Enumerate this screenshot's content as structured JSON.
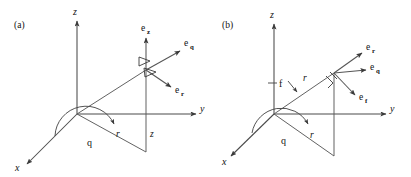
{
  "figure": {
    "caption_panels": [
      {
        "id": "a",
        "label": "(a)",
        "system": "cylindrical"
      },
      {
        "id": "b",
        "label": "(b)",
        "system": "spherical"
      }
    ],
    "background_color": "#ffffff",
    "line_color": "#4a4a4a",
    "text_color": "#111111"
  },
  "panel_a": {
    "panel_label": "(a)",
    "axes": [
      {
        "name": "z",
        "label": "z",
        "direction": "up"
      },
      {
        "name": "y",
        "label": "y",
        "direction": "right"
      },
      {
        "name": "x",
        "label": "x",
        "direction": "lower-left"
      }
    ],
    "scalars": [
      {
        "name": "radius",
        "label": "r"
      },
      {
        "name": "height",
        "label": "z"
      }
    ],
    "angles": [
      {
        "name": "theta",
        "label": "q"
      }
    ],
    "unit_vectors": [
      {
        "name": "e-z",
        "base": "e",
        "subscript": "z",
        "direction": "up"
      },
      {
        "name": "e-q",
        "base": "e",
        "subscript": "q",
        "direction": "upper-right"
      },
      {
        "name": "e-r",
        "base": "e",
        "subscript": "r",
        "direction": "lower-right"
      }
    ]
  },
  "panel_b": {
    "panel_label": "(b)",
    "axes": [
      {
        "name": "z",
        "label": "z",
        "direction": "up"
      },
      {
        "name": "y",
        "label": "y",
        "direction": "right"
      },
      {
        "name": "x",
        "label": "x",
        "direction": "lower-left"
      }
    ],
    "scalars": [
      {
        "name": "radius-upper",
        "label": "r"
      },
      {
        "name": "radius-lower",
        "label": "r"
      }
    ],
    "angles": [
      {
        "name": "theta",
        "label": "q"
      },
      {
        "name": "phi",
        "label": "f"
      }
    ],
    "unit_vectors": [
      {
        "name": "e-r",
        "base": "e",
        "subscript": "r",
        "direction": "upper-right"
      },
      {
        "name": "e-q",
        "base": "e",
        "subscript": "q",
        "direction": "right"
      },
      {
        "name": "e-f",
        "base": "e",
        "subscript": "f",
        "direction": "lower-right"
      }
    ]
  }
}
